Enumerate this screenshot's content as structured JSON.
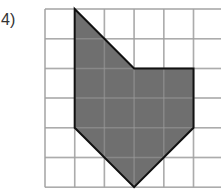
{
  "problem": {
    "label": "4)"
  },
  "grid": {
    "cols": 6,
    "rows": 6,
    "x0": 45,
    "y0": 9,
    "cell": 29.7,
    "line_color": "#c8c8c8"
  },
  "shape": {
    "fill": "#6f6f6f",
    "stroke": "#111111",
    "vertices_grid": [
      [
        1,
        0
      ],
      [
        3,
        2
      ],
      [
        5,
        2
      ],
      [
        5,
        4
      ],
      [
        3,
        6
      ],
      [
        1,
        4
      ]
    ]
  }
}
